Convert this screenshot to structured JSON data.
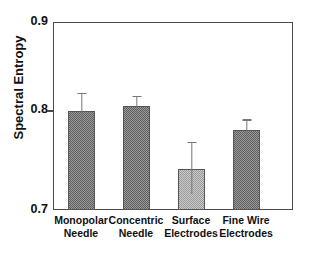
{
  "figure": {
    "title_remnant": "",
    "background": "#ffffff"
  },
  "axes": {
    "y_label": "Spectral Entropy",
    "y_ticks": [
      "0.9",
      "0.8",
      "0.7"
    ],
    "y_min": 0.7,
    "y_max": 0.9,
    "frame_color": "#4a4a4a"
  },
  "chart_data": {
    "type": "bar",
    "title": "",
    "xlabel": "",
    "ylabel": "Spectral Entropy",
    "ylim": [
      0.7,
      0.9
    ],
    "yticks": [
      0.7,
      0.8,
      0.9
    ],
    "grid": false,
    "legend": null,
    "categories": [
      "Monopolar Needle",
      "Concentric Needle",
      "Surface Electrodes",
      "Fine Wire Electrodes"
    ],
    "category_lines": [
      [
        "Monopolar",
        "Needle"
      ],
      [
        "Concentric",
        "Needle"
      ],
      [
        "Surface",
        "Electrodes"
      ],
      [
        "Fine Wire",
        "Electrodes"
      ]
    ],
    "values": [
      0.805,
      0.811,
      0.744,
      0.785
    ],
    "errors": [
      0.018,
      0.009,
      0.027,
      0.01
    ],
    "error_type": "symmetric",
    "bar_fill": [
      "hatched-dark",
      "hatched-dark",
      "hatched-light",
      "hatched-dark"
    ],
    "colors": {
      "bar_dark": "#9a9a9a",
      "bar_light": "#c9c9c9",
      "bar_edge": "#555555",
      "error_bar": "#777777"
    }
  },
  "bars": [
    {
      "name": "monopolar-needle",
      "label_line1": "Monopolar",
      "label_line2": "Needle",
      "value": 0.805,
      "error": 0.018,
      "fill": "dark"
    },
    {
      "name": "concentric-needle",
      "label_line1": "Concentric",
      "label_line2": "Needle",
      "value": 0.811,
      "error": 0.009,
      "fill": "dark"
    },
    {
      "name": "surface-electrodes",
      "label_line1": "Surface",
      "label_line2": "Electrodes",
      "value": 0.744,
      "error": 0.027,
      "fill": "light"
    },
    {
      "name": "fine-wire-electrodes",
      "label_line1": "Fine Wire",
      "label_line2": "Electrodes",
      "value": 0.785,
      "error": 0.01,
      "fill": "dark"
    }
  ]
}
